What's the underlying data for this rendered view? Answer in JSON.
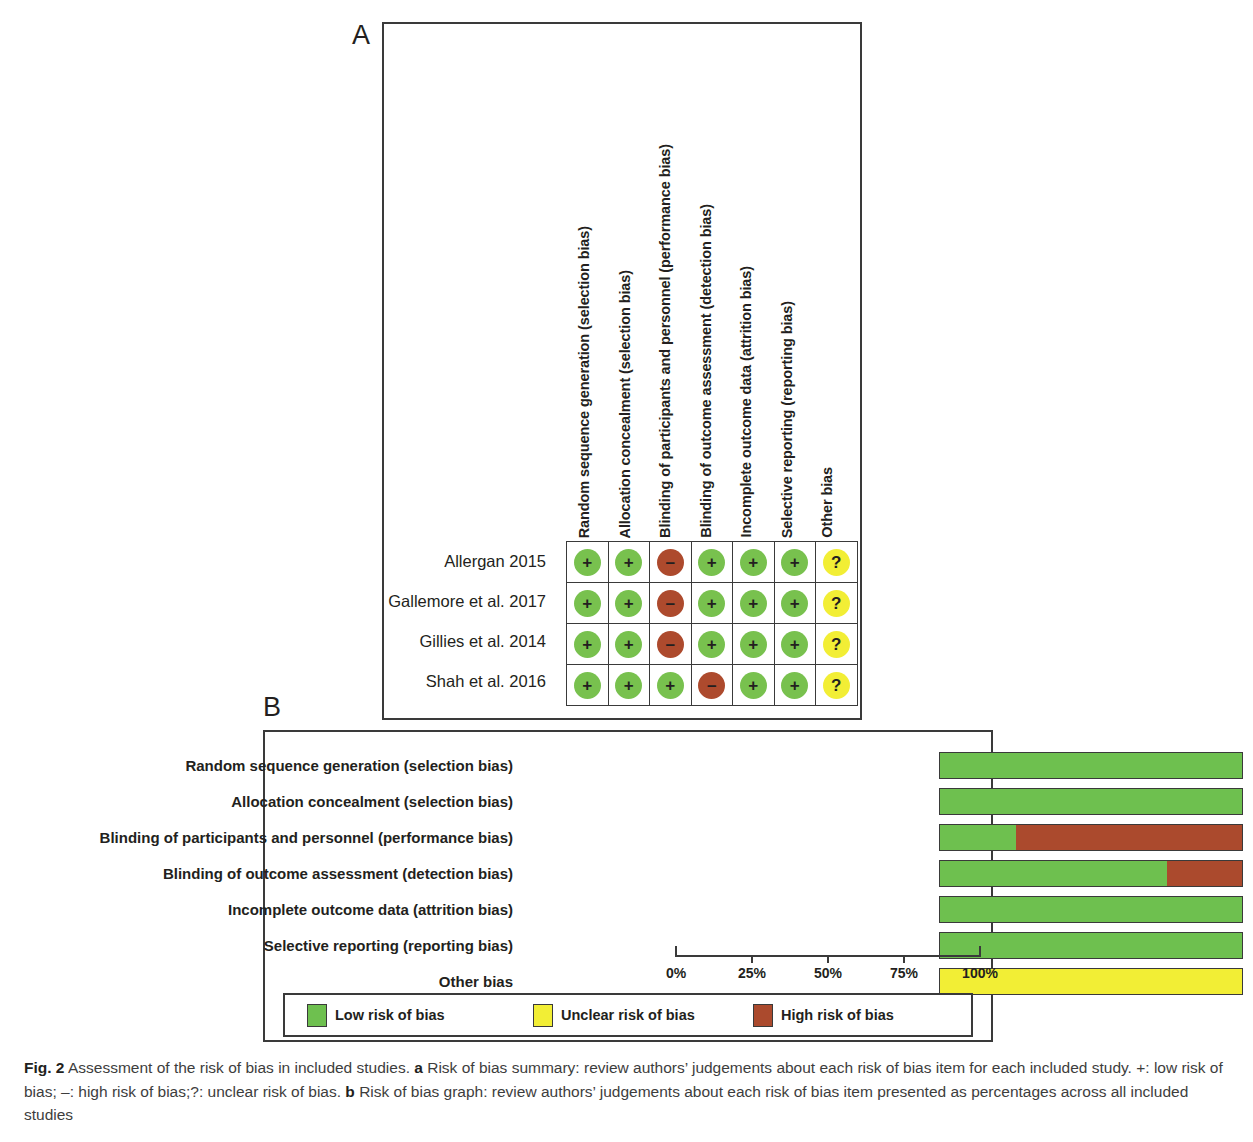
{
  "panels": {
    "a_letter": "A",
    "b_letter": "B"
  },
  "summary": {
    "domains": [
      "Random sequence generation (selection bias)",
      "Allocation concealment (selection bias)",
      "Blinding of participants and personnel (performance bias)",
      "Blinding of outcome assessment (detection bias)",
      "Incomplete outcome data (attrition bias)",
      "Selective reporting (reporting bias)",
      "Other bias"
    ],
    "studies": [
      "Allergan 2015",
      "Gallemore et al. 2017",
      "Gillies et al. 2014",
      "Shah et al. 2016"
    ],
    "judgements": [
      [
        "low",
        "low",
        "high",
        "low",
        "low",
        "low",
        "unclear"
      ],
      [
        "low",
        "low",
        "high",
        "low",
        "low",
        "low",
        "unclear"
      ],
      [
        "low",
        "low",
        "high",
        "low",
        "low",
        "low",
        "unclear"
      ],
      [
        "low",
        "low",
        "low",
        "high",
        "low",
        "low",
        "unclear"
      ]
    ],
    "symbols": {
      "low": "+",
      "high": "–",
      "unclear": "?"
    }
  },
  "legend": {
    "items": [
      {
        "label": "Low risk of bias",
        "key": "low"
      },
      {
        "label": "Unclear risk of bias",
        "key": "unclear"
      },
      {
        "label": "High risk of bias",
        "key": "high"
      }
    ]
  },
  "colors": {
    "low": "#6ec04f",
    "unclear": "#f2ee35",
    "high": "#ab4a2d",
    "outline": "#3a3a3a"
  },
  "caption": {
    "figure_number": "Fig. 2",
    "text": " Assessment of the risk of bias in included studies. ",
    "part_a_marker": "a",
    "part_a_text": " Risk of bias summary: review authors’ judgements about each risk of bias item for each included study. +: low risk of bias; –: high risk of bias;?: unclear risk of bias. ",
    "part_b_marker": "b",
    "part_b_text": " Risk of bias graph: review authors’ judgements about each risk of bias item presented as percentages across all included studies"
  },
  "chart_data": {
    "type": "bar",
    "orientation": "horizontal",
    "stacked": true,
    "title": "Risk of bias graph",
    "xlabel": "",
    "ylabel": "",
    "xlim": [
      0,
      100
    ],
    "grid": false,
    "legend_position": "bottom",
    "tick_labels": [
      "0%",
      "25%",
      "50%",
      "75%",
      "100%"
    ],
    "tick_values": [
      0,
      25,
      50,
      75,
      100
    ],
    "categories": [
      "Random sequence generation (selection bias)",
      "Allocation concealment (selection bias)",
      "Blinding of participants and personnel (performance bias)",
      "Blinding of outcome assessment (detection bias)",
      "Incomplete outcome data (attrition bias)",
      "Selective reporting (reporting bias)",
      "Other bias"
    ],
    "series": [
      {
        "name": "Low risk of bias",
        "key": "low",
        "color": "#6ec04f",
        "values": [
          100,
          100,
          25,
          75,
          100,
          100,
          0
        ]
      },
      {
        "name": "Unclear risk of bias",
        "key": "unclear",
        "color": "#f2ee35",
        "values": [
          0,
          0,
          0,
          0,
          0,
          0,
          100
        ]
      },
      {
        "name": "High risk of bias",
        "key": "high",
        "color": "#ab4a2d",
        "values": [
          0,
          0,
          75,
          25,
          0,
          0,
          0
        ]
      }
    ]
  }
}
